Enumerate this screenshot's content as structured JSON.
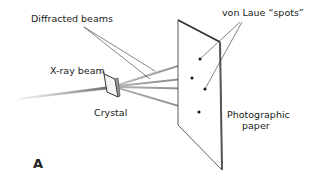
{
  "diagram": {
    "panel_letter": "A",
    "labels": {
      "diffracted_beams": "Diffracted beams",
      "von_laue": "von Laue “spots”",
      "xray_beam": "X-ray beam",
      "crystal": "Crystal",
      "photographic_line1": "Photographic",
      "photographic_line2": "paper"
    },
    "colors": {
      "line": "#333333",
      "beam": "#999999",
      "spot": "#111111"
    }
  }
}
